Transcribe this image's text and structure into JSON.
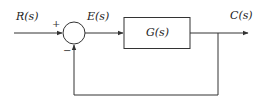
{
  "diagram": {
    "type": "closed-loop feedback block diagram",
    "input_label": "R(s)",
    "error_label": "E(s)",
    "block_label": "G(s)",
    "output_label": "C(s)",
    "summing_junction": {
      "plus_sign": "+",
      "minus_sign": "−"
    },
    "colors": {
      "line": "#333333",
      "background": "#ffffff"
    }
  }
}
